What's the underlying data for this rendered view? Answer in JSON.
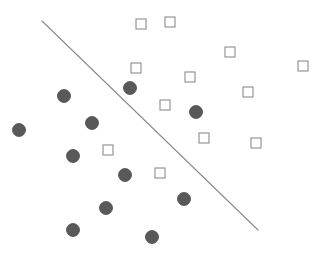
{
  "figure": {
    "title": "",
    "background_color": "#ffffff",
    "width": 322,
    "height": 255
  },
  "chart_data": {
    "type": "scatter",
    "title": "",
    "subtitle": "",
    "xlabel": "",
    "ylabel": "",
    "xlim": [
      0,
      322
    ],
    "ylim": [
      255,
      0
    ],
    "grid": false,
    "axes_visible": false,
    "tick_labels_x": [],
    "tick_labels_y": [],
    "legend": {
      "visible": false,
      "position": "none",
      "entries": [
        {
          "label": "Class A (filled circle)",
          "marker": "circle",
          "color": "#595959"
        },
        {
          "label": "Class B (open square)",
          "marker": "square",
          "color": "#8c8c8c"
        }
      ]
    },
    "annotations": [
      {
        "name": "decision-boundary",
        "type": "line",
        "x1": 42,
        "y1": 21,
        "x2": 258,
        "y2": 230,
        "color": "#8a8a8a",
        "width": 1.1,
        "label": ""
      }
    ],
    "series": [
      {
        "name": "Class A (filled circle)",
        "marker": "circle",
        "filled": true,
        "color": "#595959",
        "edge_color": "#4a4a4a",
        "size": 13,
        "points": [
          {
            "x": 19,
            "y": 130
          },
          {
            "x": 64,
            "y": 96
          },
          {
            "x": 92,
            "y": 123
          },
          {
            "x": 73,
            "y": 156
          },
          {
            "x": 130,
            "y": 88
          },
          {
            "x": 125,
            "y": 175
          },
          {
            "x": 196,
            "y": 112
          },
          {
            "x": 106,
            "y": 208
          },
          {
            "x": 184,
            "y": 199
          },
          {
            "x": 73,
            "y": 230
          },
          {
            "x": 152,
            "y": 237
          }
        ]
      },
      {
        "name": "Class B (open square)",
        "marker": "square",
        "filled": false,
        "color": "#ffffff",
        "edge_color": "#8c8c8c",
        "size": 10,
        "points": [
          {
            "x": 141,
            "y": 24
          },
          {
            "x": 170,
            "y": 22
          },
          {
            "x": 230,
            "y": 52
          },
          {
            "x": 136,
            "y": 68
          },
          {
            "x": 190,
            "y": 77
          },
          {
            "x": 303,
            "y": 66
          },
          {
            "x": 248,
            "y": 92
          },
          {
            "x": 165,
            "y": 105
          },
          {
            "x": 204,
            "y": 138
          },
          {
            "x": 108,
            "y": 150
          },
          {
            "x": 256,
            "y": 143
          },
          {
            "x": 160,
            "y": 173
          }
        ]
      }
    ]
  }
}
